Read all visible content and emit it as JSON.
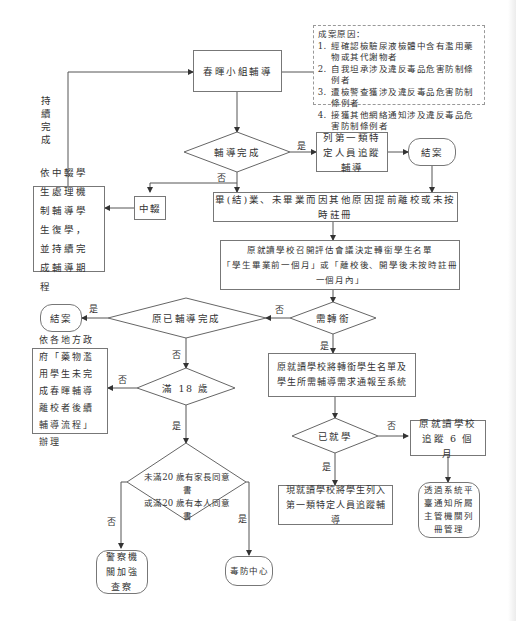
{
  "note": {
    "title": "成案原因：",
    "items": [
      "經確認檢驗尿液檢體中含有濫用藥物或其代謝物者",
      "自我坦承涉及違反毒品危害防制條例者",
      "遭檢警查獲涉及違反毒品危害防制條例者",
      "接獲其他網絡通知涉及違反毒品危害防制條例者"
    ]
  },
  "nodes": {
    "chunhui": "春暉小組輔導",
    "fudao_done": "輔導完成",
    "list_first": "列第一類特定人員追蹤輔導",
    "end1": "結案",
    "dropout": "中輟",
    "dropout_handle": "依中輟學生處理機制輔導學生復學，並持續完成輔導期程",
    "graduate": "畢(結)業、未畢業而因其他原因提前離校或未按時註冊",
    "review_line1": "原就讀學校召開評估會議決定轉銜學生名單",
    "review_line2": "「學生畢業前一個月」或「離校後、開學後未按時註冊一個月內」",
    "need_transfer": "需轉銜",
    "prev_done": "原已輔導完成",
    "end2": "結案",
    "report": "原就讀學校將轉銜學生名單及學生所需輔導需求通報至系統",
    "local_gov": "依各地方政府「藥物濫用學生未完成春暉輔導離校者後續輔導流程」辦理",
    "age18": "滿 18 歲",
    "enrolled": "已就學",
    "track6": "原就讀學校追蹤 6 個月",
    "consent_line1": "未滿20 歲有家長同意書",
    "consent_line2": "或滿20 歲有本人同意書",
    "current_school": "現就讀學校將學生列入第一類特定人員追蹤輔導",
    "notify": "透過系統平臺通知所屬主管機關列冊管理",
    "police": "警察機關加強查察",
    "drug_center": "毒防中心"
  },
  "labels": {
    "continue_done": "持續完成",
    "yes": "是",
    "no": "否"
  },
  "colors": {
    "line": "#555555",
    "border": "#777777",
    "text": "#333333"
  }
}
